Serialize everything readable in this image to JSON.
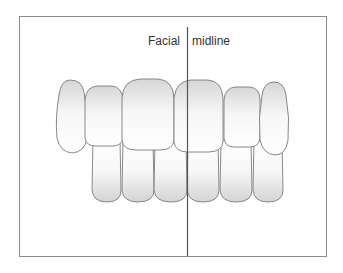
{
  "labels": {
    "left": "Facial",
    "right": "midline"
  },
  "colors": {
    "frame": "#8a8a8a",
    "midline": "#555555",
    "tooth_outline": "#7a7a7a",
    "tooth_fill_light": "#ffffff",
    "tooth_fill_dark": "#d8d8d8"
  }
}
